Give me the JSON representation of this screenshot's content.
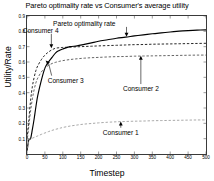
{
  "chart_data": {
    "type": "line",
    "title": "Pareto optimality rate vs Consumer's average utility",
    "xlabel": "Timestep",
    "ylabel": "Utility/Rate",
    "xlim": [
      0,
      500
    ],
    "ylim": [
      0,
      0.9
    ],
    "grid": false,
    "legend_position": "none (inline arrow annotations)",
    "xticks": [
      0,
      50,
      100,
      150,
      200,
      250,
      300,
      350,
      400,
      450,
      500
    ],
    "xticklabels": [
      "0",
      "50",
      "100",
      "150",
      "200",
      "250",
      "300",
      "350",
      "400",
      "450",
      "500"
    ],
    "yticks": [
      0.1,
      0.2,
      0.3,
      0.4,
      0.5,
      0.6,
      0.7,
      0.8,
      0.9
    ],
    "yticklabels": [
      "0.1",
      "0.2",
      "0.3",
      "0.4",
      "0.5",
      "0.6",
      "0.7",
      "0.8",
      "0.9"
    ],
    "x": [
      0,
      5,
      10,
      15,
      20,
      25,
      30,
      40,
      50,
      60,
      70,
      80,
      90,
      100,
      120,
      140,
      160,
      180,
      200,
      225,
      250,
      275,
      300,
      325,
      350,
      375,
      400,
      425,
      450,
      475,
      500
    ],
    "series": [
      {
        "name": "Pareto optimality rate",
        "style": "solid",
        "color": "#000000",
        "values": [
          0.02,
          0.09,
          0.1,
          0.16,
          0.23,
          0.31,
          0.38,
          0.48,
          0.56,
          0.6,
          0.63,
          0.66,
          0.675,
          0.685,
          0.7,
          0.705,
          0.715,
          0.725,
          0.735,
          0.745,
          0.755,
          0.762,
          0.77,
          0.777,
          0.784,
          0.79,
          0.796,
          0.801,
          0.805,
          0.808,
          0.81
        ]
      },
      {
        "name": "Consumer 4",
        "style": "dashed",
        "color": "#000000",
        "values": [
          0.1,
          0.22,
          0.35,
          0.44,
          0.5,
          0.545,
          0.575,
          0.615,
          0.645,
          0.665,
          0.68,
          0.69,
          0.693,
          0.695,
          0.697,
          0.699,
          0.701,
          0.703,
          0.705,
          0.707,
          0.709,
          0.711,
          0.713,
          0.714,
          0.716,
          0.717,
          0.718,
          0.719,
          0.72,
          0.721,
          0.722
        ]
      },
      {
        "name": "Consumer 3",
        "style": "dashed",
        "color": "#4a4a4a",
        "values": [
          0.08,
          0.18,
          0.28,
          0.36,
          0.42,
          0.465,
          0.495,
          0.535,
          0.56,
          0.578,
          0.59,
          0.598,
          0.604,
          0.609,
          0.616,
          0.621,
          0.625,
          0.628,
          0.63,
          0.633,
          0.635,
          0.636,
          0.638,
          0.639,
          0.64,
          0.641,
          0.642,
          0.643,
          0.644,
          0.645,
          0.645
        ]
      },
      {
        "name": "Consumer 1",
        "style": "dashed",
        "color": "#9a9a9a",
        "values": [
          0.01,
          0.09,
          0.098,
          0.103,
          0.108,
          0.113,
          0.118,
          0.128,
          0.137,
          0.146,
          0.154,
          0.161,
          0.167,
          0.173,
          0.182,
          0.189,
          0.195,
          0.199,
          0.203,
          0.207,
          0.21,
          0.212,
          0.214,
          0.215,
          0.217,
          0.218,
          0.219,
          0.22,
          0.221,
          0.222,
          0.222
        ]
      }
    ],
    "annotations": [
      {
        "text": "Pareto optimality rate",
        "label_x": 160,
        "label_y": 0.855,
        "arrow": "down",
        "target_x": 278,
        "target_y": 0.765
      },
      {
        "text": "Consumer 4",
        "label_x": 38,
        "label_y": 0.81,
        "arrow": "down",
        "target_x": 68,
        "target_y": 0.69
      },
      {
        "text": "Consumer 3",
        "label_x": 108,
        "label_y": 0.485,
        "arrow": "leader-up-left",
        "target_x": 52,
        "target_y": 0.61
      },
      {
        "text": "Consumer 2",
        "label_x": 318,
        "label_y": 0.43,
        "arrow": "up",
        "target_x": 318,
        "target_y": 0.64
      },
      {
        "text": "Consumer 1",
        "label_x": 262,
        "label_y": 0.145,
        "arrow": "up",
        "target_x": 262,
        "target_y": 0.212
      }
    ]
  }
}
